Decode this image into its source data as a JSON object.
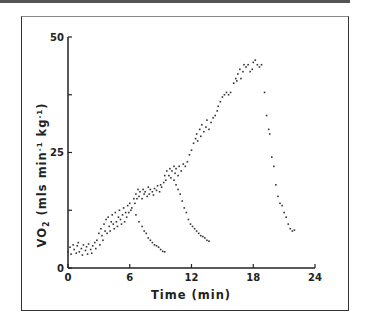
{
  "chart_data": {
    "type": "scatter",
    "title": "",
    "xlabel": "Time (min)",
    "ylabel": "V̇O₂ (mls min⁻¹ kg⁻¹)",
    "ylabel_parts": {
      "v": "VO",
      "sub": "2",
      "rest_pre": " (mls min",
      "sup1": "-1",
      "mid": " kg",
      "sup2": "-1",
      "close": ")"
    },
    "xlim": [
      0,
      24
    ],
    "ylim": [
      0,
      50
    ],
    "xticks": [
      0,
      6,
      12,
      18,
      24
    ],
    "yticks_labeled": [
      0,
      25,
      50
    ],
    "yticks_unlabeled": [
      12.5,
      37.5
    ],
    "grid": false,
    "legend": null,
    "series": [
      {
        "name": "incremental exercise",
        "points": [
          [
            0,
            3.5
          ],
          [
            0.2,
            4.5
          ],
          [
            0.3,
            3
          ],
          [
            0.5,
            5
          ],
          [
            0.6,
            4
          ],
          [
            0.8,
            3.2
          ],
          [
            0.9,
            4.8
          ],
          [
            1,
            5.5
          ],
          [
            1.1,
            3.5
          ],
          [
            1.3,
            4.2
          ],
          [
            1.4,
            2.8
          ],
          [
            1.5,
            5
          ],
          [
            1.7,
            3.8
          ],
          [
            1.8,
            4.6
          ],
          [
            1.9,
            3
          ],
          [
            2,
            5.2
          ],
          [
            2.2,
            4
          ],
          [
            2.3,
            3.2
          ],
          [
            2.4,
            4.8
          ],
          [
            2.6,
            5.5
          ],
          [
            2.7,
            4.2
          ],
          [
            2.8,
            6
          ],
          [
            3,
            7.5
          ],
          [
            3.1,
            5
          ],
          [
            3.2,
            8.5
          ],
          [
            3.3,
            7
          ],
          [
            3.4,
            6
          ],
          [
            3.5,
            9.5
          ],
          [
            3.6,
            8
          ],
          [
            3.7,
            10.5
          ],
          [
            3.8,
            7.5
          ],
          [
            3.9,
            11
          ],
          [
            4,
            9
          ],
          [
            4.1,
            8
          ],
          [
            4.2,
            10
          ],
          [
            4.3,
            11.5
          ],
          [
            4.4,
            9.5
          ],
          [
            4.5,
            8.5
          ],
          [
            4.6,
            12
          ],
          [
            4.7,
            10
          ],
          [
            4.8,
            9
          ],
          [
            4.9,
            11
          ],
          [
            5,
            12.5
          ],
          [
            5.1,
            10.5
          ],
          [
            5.2,
            9.5
          ],
          [
            5.3,
            11.5
          ],
          [
            5.4,
            13
          ],
          [
            5.5,
            10
          ],
          [
            5.6,
            12
          ],
          [
            5.7,
            11
          ],
          [
            5.8,
            13.5
          ],
          [
            5.9,
            12
          ],
          [
            6,
            14
          ],
          [
            6.1,
            12.5
          ],
          [
            6.2,
            13
          ],
          [
            6.4,
            15
          ],
          [
            6.5,
            14
          ],
          [
            6.6,
            16
          ],
          [
            6.7,
            15
          ],
          [
            6.8,
            17
          ],
          [
            6.9,
            15.5
          ],
          [
            7,
            16.5
          ],
          [
            7.2,
            15
          ],
          [
            7.3,
            17
          ],
          [
            7.4,
            16
          ],
          [
            7.5,
            16.5
          ],
          [
            7.7,
            15.5
          ],
          [
            7.8,
            17.5
          ],
          [
            7.9,
            16
          ],
          [
            8,
            17
          ],
          [
            8.2,
            16.5
          ],
          [
            8.3,
            15.8
          ],
          [
            8.4,
            17.2
          ],
          [
            8.6,
            16.8
          ],
          [
            8.7,
            17.8
          ],
          [
            8.9,
            16.5
          ],
          [
            9,
            18
          ],
          [
            9.1,
            17.5
          ],
          [
            9.3,
            18.5
          ],
          [
            9.4,
            20
          ],
          [
            9.5,
            19
          ],
          [
            9.6,
            21
          ],
          [
            9.8,
            20
          ],
          [
            9.9,
            21.5
          ],
          [
            10,
            19.5
          ],
          [
            10.1,
            21
          ],
          [
            10.3,
            22
          ],
          [
            10.4,
            20.5
          ],
          [
            10.5,
            21.5
          ],
          [
            10.7,
            20
          ],
          [
            10.8,
            22
          ],
          [
            11,
            21
          ],
          [
            11.2,
            22.5
          ],
          [
            11.4,
            22
          ],
          [
            11.6,
            23
          ],
          [
            11.8,
            24.5
          ],
          [
            12,
            25.5
          ],
          [
            12.2,
            27
          ],
          [
            12.4,
            28
          ],
          [
            12.5,
            29
          ],
          [
            12.6,
            27.5
          ],
          [
            12.8,
            30
          ],
          [
            12.9,
            28.5
          ],
          [
            13,
            31
          ],
          [
            13.2,
            29.5
          ],
          [
            13.4,
            30.5
          ],
          [
            13.5,
            32
          ],
          [
            13.7,
            30
          ],
          [
            13.9,
            31.5
          ],
          [
            14.1,
            32.5
          ],
          [
            14.3,
            33
          ],
          [
            14.5,
            34
          ],
          [
            14.6,
            35
          ],
          [
            14.8,
            36
          ],
          [
            15,
            37
          ],
          [
            15.2,
            37.5
          ],
          [
            15.4,
            38
          ],
          [
            15.6,
            37.5
          ],
          [
            15.8,
            38
          ],
          [
            16.1,
            40
          ],
          [
            16.3,
            41
          ],
          [
            16.4,
            40.5
          ],
          [
            16.5,
            42
          ],
          [
            16.7,
            43
          ],
          [
            16.8,
            41
          ],
          [
            17,
            42.5
          ],
          [
            17.1,
            44
          ],
          [
            17.3,
            43.5
          ],
          [
            17.5,
            44
          ],
          [
            17.7,
            42.5
          ],
          [
            17.9,
            43
          ],
          [
            18,
            44.5
          ],
          [
            18.2,
            45
          ],
          [
            18.4,
            44
          ],
          [
            18.6,
            43.5
          ],
          [
            18.8,
            44
          ]
        ]
      },
      {
        "name": "recovery 1",
        "points": [
          [
            6.6,
            11.5
          ],
          [
            6.9,
            10
          ],
          [
            7.2,
            9
          ],
          [
            7.4,
            8
          ],
          [
            7.6,
            7.5
          ],
          [
            7.8,
            6.5
          ],
          [
            8,
            6
          ],
          [
            8.2,
            5.5
          ],
          [
            8.4,
            5
          ],
          [
            8.6,
            4.8
          ],
          [
            8.8,
            4.5
          ],
          [
            9,
            4
          ],
          [
            9.2,
            3.6
          ],
          [
            9.4,
            3.5
          ]
        ]
      },
      {
        "name": "recovery 2",
        "points": [
          [
            10.3,
            19
          ],
          [
            10.5,
            18
          ],
          [
            10.7,
            17
          ],
          [
            10.9,
            16
          ],
          [
            11.1,
            14.5
          ],
          [
            11.3,
            13
          ],
          [
            11.5,
            12
          ],
          [
            11.7,
            10.5
          ],
          [
            11.9,
            9.5
          ],
          [
            12.1,
            9
          ],
          [
            12.3,
            8.5
          ],
          [
            12.5,
            8
          ],
          [
            12.7,
            7.5
          ],
          [
            12.9,
            7
          ],
          [
            13.1,
            6.8
          ],
          [
            13.3,
            6.5
          ],
          [
            13.5,
            6
          ],
          [
            13.7,
            5.8
          ]
        ]
      },
      {
        "name": "recovery 3",
        "points": [
          [
            19.1,
            38
          ],
          [
            19.3,
            33
          ],
          [
            19.5,
            30
          ],
          [
            19.6,
            29
          ],
          [
            19.8,
            24
          ],
          [
            20,
            22
          ],
          [
            20.2,
            18
          ],
          [
            20.4,
            15.5
          ],
          [
            20.6,
            14
          ],
          [
            20.8,
            13.5
          ],
          [
            21,
            12
          ],
          [
            21.2,
            11
          ],
          [
            21.4,
            9.5
          ],
          [
            21.6,
            8.5
          ],
          [
            21.8,
            8
          ],
          [
            22,
            8.2
          ]
        ]
      }
    ]
  }
}
